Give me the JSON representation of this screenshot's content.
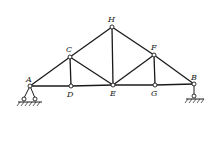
{
  "diagram": {
    "type": "truss",
    "joints": [
      {
        "id": "A",
        "label": "A"
      },
      {
        "id": "B",
        "label": "B"
      },
      {
        "id": "C",
        "label": "C"
      },
      {
        "id": "D",
        "label": "D"
      },
      {
        "id": "E",
        "label": "E"
      },
      {
        "id": "F",
        "label": "F"
      },
      {
        "id": "G",
        "label": "G"
      },
      {
        "id": "H",
        "label": "H"
      }
    ],
    "members": [
      "AC",
      "CH",
      "HF",
      "FB",
      "AD",
      "DE",
      "EG",
      "GB",
      "CD",
      "CE",
      "HE",
      "FE",
      "FG"
    ],
    "supports": [
      {
        "joint": "A",
        "type": "pin"
      },
      {
        "joint": "B",
        "type": "roller"
      }
    ]
  }
}
